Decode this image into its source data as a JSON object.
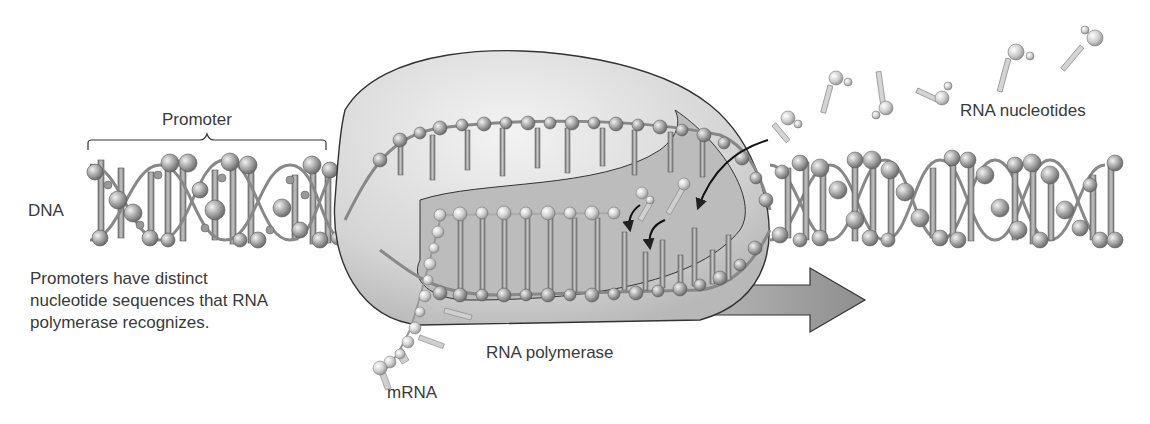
{
  "figure": {
    "labels": {
      "promoter": "Promoter",
      "dna": "DNA",
      "rna_nucleotides": "RNA nucleotides",
      "rna_polymerase": "RNA polymerase",
      "mrna": "mRNA"
    },
    "caption_lines": [
      "Promoters have distinct",
      "nucleotide sequences that RNA",
      "polymerase recognizes."
    ],
    "colors": {
      "background": "#ffffff",
      "polymerase_fill": "#d9d9d9",
      "polymerase_inner": "#bdbdbd",
      "dna_bead": "#a8a8a8",
      "rna_bead": "#dcdcdc",
      "arrow": "#8c8c8c",
      "outline": "#3c3c3c"
    },
    "direction_arrow": "right"
  }
}
